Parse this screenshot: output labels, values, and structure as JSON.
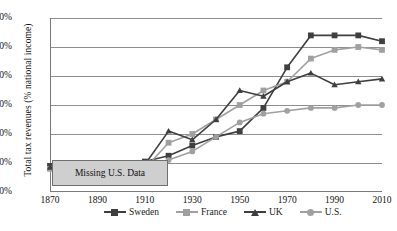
{
  "chart_data": {
    "type": "line",
    "title": "",
    "xlabel": "",
    "ylabel": "Total tax revenues (% national income)",
    "xlim": [
      1870,
      2010
    ],
    "ylim": [
      0,
      60
    ],
    "xticks": [
      "1870",
      "1890",
      "1910",
      "1930",
      "1950",
      "1970",
      "1990",
      "2010"
    ],
    "yticks": [
      "0%",
      "10%",
      "20%",
      "30%",
      "40%",
      "50%",
      "60%"
    ],
    "grid": "horizontal",
    "legend_position": "bottom",
    "x": [
      1870,
      1880,
      1890,
      1900,
      1910,
      1920,
      1930,
      1940,
      1950,
      1960,
      1970,
      1980,
      1990,
      2000,
      2010
    ],
    "series": [
      {
        "name": "Sweden",
        "marker": "square",
        "color": "#3f3f3f",
        "values": [
          9,
          8,
          9,
          9,
          10.5,
          12.5,
          16,
          19,
          21,
          29,
          43,
          54,
          54,
          54,
          52
        ]
      },
      {
        "name": "France",
        "marker": "square",
        "color": "#a0a0a0",
        "values": [
          8,
          7,
          8,
          8,
          8,
          17,
          20,
          25,
          30,
          35,
          38,
          46,
          49,
          50,
          49
        ]
      },
      {
        "name": "UK",
        "marker": "triangle",
        "color": "#3f3f3f",
        "values": [
          8.5,
          9,
          9,
          9,
          9.5,
          21,
          18,
          25,
          35,
          33,
          38,
          41,
          37,
          38,
          39
        ]
      },
      {
        "name": "U.S.",
        "marker": "circle",
        "color": "#a0a0a0",
        "values": [
          null,
          null,
          null,
          null,
          7.5,
          11,
          14,
          19,
          24,
          27,
          28,
          29,
          29,
          30,
          30
        ]
      }
    ],
    "annotations": [
      {
        "text": "Missing U.S. Data",
        "x_start": 1870,
        "x_end": 1903,
        "y": 2
      }
    ]
  },
  "legend": {
    "items": [
      {
        "label": "Sweden"
      },
      {
        "label": "France"
      },
      {
        "label": "UK"
      },
      {
        "label": "U.S."
      }
    ]
  }
}
